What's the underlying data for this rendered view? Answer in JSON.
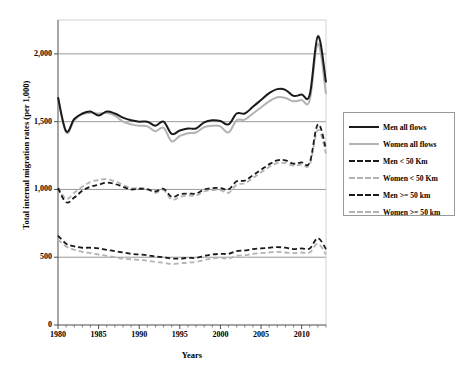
{
  "chart_data": {
    "type": "line",
    "title": "",
    "xlabel": "Years",
    "ylabel": "Total internal migration rates (per 1,000)",
    "xlim": [
      1980,
      2013
    ],
    "ylim": [
      0,
      2250
    ],
    "yticks": [
      0,
      500,
      1000,
      1500,
      2000
    ],
    "ytick_labels": [
      "0",
      "500",
      "1,000",
      "1,500",
      "2,000"
    ],
    "xticks": [
      1980,
      1985,
      1990,
      1995,
      2000,
      2005,
      2010
    ],
    "xtick_labels": [
      "1980",
      "1985",
      "1990",
      "1995",
      "2000",
      "2005",
      "2010"
    ],
    "grid": "horizontal",
    "legend_position": "right",
    "x": [
      1980,
      1981,
      1982,
      1983,
      1984,
      1985,
      1986,
      1987,
      1988,
      1989,
      1990,
      1991,
      1992,
      1993,
      1994,
      1995,
      1996,
      1997,
      1998,
      1999,
      2000,
      2001,
      2002,
      2003,
      2004,
      2005,
      2006,
      2007,
      2008,
      2009,
      2010,
      2011,
      2012,
      2013
    ],
    "series": [
      {
        "name": "Men all flows",
        "color": "#1a1a1a",
        "style": "solid",
        "width": 2.0,
        "values": [
          1680,
          1430,
          1520,
          1560,
          1575,
          1545,
          1575,
          1560,
          1530,
          1510,
          1500,
          1500,
          1470,
          1500,
          1410,
          1435,
          1450,
          1450,
          1495,
          1510,
          1505,
          1480,
          1560,
          1560,
          1610,
          1660,
          1710,
          1740,
          1735,
          1690,
          1700,
          1700,
          2130,
          1790
        ]
      },
      {
        "name": "Women all flows",
        "color": "#b3b3b3",
        "style": "solid",
        "width": 2.0,
        "values": [
          1680,
          1420,
          1510,
          1555,
          1565,
          1560,
          1565,
          1545,
          1500,
          1480,
          1470,
          1465,
          1430,
          1455,
          1355,
          1395,
          1415,
          1420,
          1460,
          1470,
          1465,
          1420,
          1510,
          1515,
          1560,
          1605,
          1650,
          1680,
          1675,
          1650,
          1660,
          1660,
          2075,
          1705
        ]
      },
      {
        "name": "Men < 50 Km",
        "color": "#1a1a1a",
        "style": "dashed",
        "width": 1.8,
        "values": [
          1010,
          905,
          940,
          990,
          1020,
          1035,
          1050,
          1040,
          1020,
          1000,
          1005,
          1000,
          985,
          1005,
          945,
          965,
          970,
          970,
          1000,
          1010,
          1010,
          1000,
          1060,
          1065,
          1105,
          1145,
          1185,
          1215,
          1215,
          1190,
          1200,
          1200,
          1480,
          1300
        ]
      },
      {
        "name": "Women < 50 Km",
        "color": "#b3b3b3",
        "style": "dashed",
        "width": 1.8,
        "values": [
          1020,
          930,
          975,
          1020,
          1055,
          1070,
          1075,
          1060,
          1035,
          1010,
          1010,
          1005,
          975,
          995,
          925,
          945,
          955,
          955,
          985,
          995,
          995,
          975,
          1035,
          1045,
          1085,
          1125,
          1165,
          1195,
          1195,
          1175,
          1185,
          1185,
          1440,
          1265
        ]
      },
      {
        "name": "Men >= 50 km",
        "color": "#1a1a1a",
        "style": "dashed",
        "width": 1.8,
        "values": [
          660,
          600,
          580,
          570,
          570,
          565,
          555,
          545,
          535,
          525,
          520,
          515,
          505,
          500,
          490,
          490,
          495,
          495,
          510,
          520,
          525,
          525,
          545,
          550,
          560,
          565,
          570,
          575,
          570,
          560,
          565,
          565,
          640,
          560
        ]
      },
      {
        "name": "Women >= 50 km",
        "color": "#b3b3b3",
        "style": "dashed",
        "width": 1.8,
        "values": [
          630,
          580,
          555,
          540,
          530,
          520,
          510,
          500,
          490,
          485,
          480,
          475,
          465,
          460,
          450,
          455,
          460,
          465,
          480,
          490,
          495,
          490,
          510,
          515,
          525,
          530,
          535,
          540,
          535,
          530,
          535,
          535,
          600,
          520
        ]
      }
    ]
  },
  "legend": {
    "items": [
      {
        "label": "Men all flows"
      },
      {
        "label": "Women all flows"
      },
      {
        "label": "Men < 50 Km"
      },
      {
        "label": "Women < 50 Km"
      },
      {
        "label": "Men >= 50 km"
      },
      {
        "label": "Women >= 50 km"
      }
    ]
  }
}
